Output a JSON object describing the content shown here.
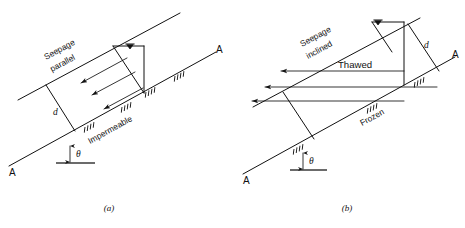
{
  "figure": {
    "background_color": "#ffffff",
    "line_color": "#111111",
    "panels": [
      {
        "id": "a",
        "caption": "(a)",
        "labels": {
          "seepage": "Seepage\nparallel",
          "seepage_line1": "Seepage",
          "seepage_line2": "parallel",
          "boundary": "Impermeable",
          "depth": "d",
          "angle": "θ",
          "section_left": "A",
          "section_right": "A",
          "water_table_icon": "water-table-symbol"
        },
        "flow_arrow_count": 3,
        "flow_direction": "down-slope (to the left), parallel to slope surface"
      },
      {
        "id": "b",
        "caption": "(b)",
        "labels": {
          "seepage_line1": "Seepage",
          "seepage_line2": "inclined",
          "zone_upper": "Thawed",
          "zone_lower": "Frozen",
          "depth": "d",
          "angle": "θ",
          "section_left": "A",
          "section_right": "A",
          "water_table_icon": "water-table-symbol"
        },
        "flow_arrow_count": 3,
        "flow_direction": "inclined, emerging toward the left out of the slope face"
      }
    ]
  }
}
